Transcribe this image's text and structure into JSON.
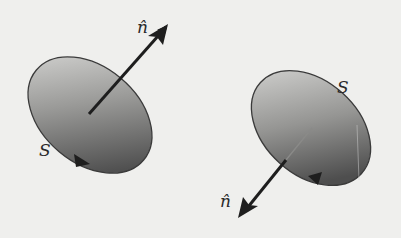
{
  "figure": {
    "background_color": "#efefed",
    "ink_color": "#1e1e1e",
    "surface_gradient": [
      "#d8d8d6",
      "#5a5a5a"
    ],
    "panels": [
      {
        "id": "left",
        "surface_label": "S",
        "normal_label": "n̂",
        "normal_direction": "up-right (out of front face)",
        "boundary_arrow": "lower rim, pointing right"
      },
      {
        "id": "right",
        "surface_label": "S",
        "normal_label": "n̂",
        "normal_direction": "down-left (through surface)",
        "boundary_arrow": "lower rim, pointing left"
      }
    ]
  }
}
